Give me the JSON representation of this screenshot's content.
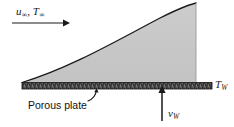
{
  "figure": {
    "name": "boundary-layer-over-porous-plate",
    "background_color": "#ffffff",
    "width": 234,
    "height": 127
  },
  "labels": {
    "freestream": {
      "velocity_symbol": "u",
      "velocity_subscript": "∞",
      "separator": ",",
      "temperature_symbol": "T",
      "temperature_subscript": "∞",
      "text": "u∞, T∞"
    },
    "wall_temperature": {
      "symbol": "T",
      "subscript": "W",
      "text": "TW"
    },
    "wall_velocity": {
      "symbol": "v",
      "subscript": "W",
      "text": "vW"
    },
    "porous_plate": {
      "text": "Porous plate"
    }
  },
  "elements": {
    "freestream_arrow": {
      "name": "freestream-arrow",
      "direction": "right",
      "x_start": 12,
      "x_end": 68,
      "y": 23
    },
    "blowing_arrow": {
      "name": "blowing-arrow",
      "direction": "up",
      "x": 162,
      "y_start": 121,
      "y_end": 86
    },
    "leader_line": {
      "name": "porous-plate-leader",
      "from_x": 92,
      "from_y": 100,
      "to_x": 96,
      "to_y": 89
    },
    "boundary_layer": {
      "name": "boundary-layer-region",
      "fill_color": "#c8c8c8",
      "edge_color": "#1a1a1a",
      "leading_edge_x": 22,
      "leading_edge_y": 82,
      "trailing_edge_x": 196,
      "trailing_edge_top_y": 3
    },
    "plate": {
      "name": "porous-plate-band",
      "fill_color": "#2b2b2b",
      "x_start": 22,
      "x_end": 212,
      "y_top": 82,
      "y_bottom": 89
    }
  },
  "colors": {
    "shading": "#c8c8c8",
    "plate": "#2b2b2b",
    "ink": "#1a1a1a",
    "paper": "#ffffff"
  }
}
